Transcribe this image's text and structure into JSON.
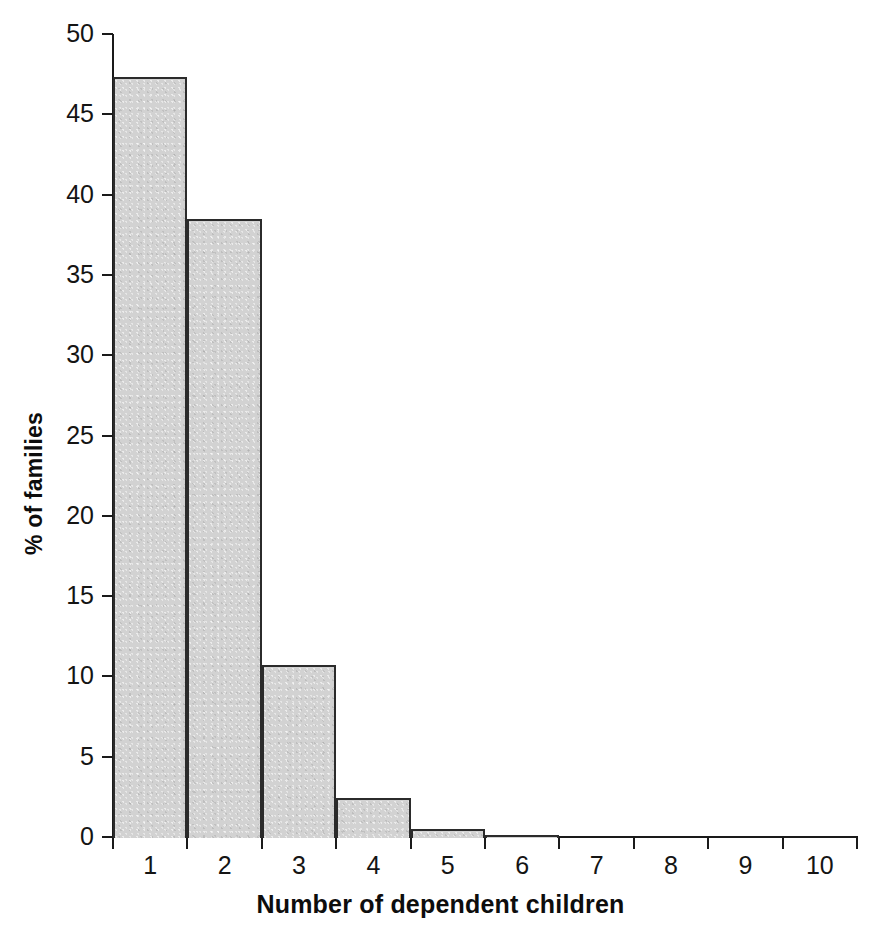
{
  "chart_data": {
    "type": "bar",
    "title": "",
    "subtitle": "",
    "xlabel": "Number of dependent children",
    "ylabel": "% of families",
    "categories": [
      "1",
      "2",
      "3",
      "4",
      "5",
      "6",
      "7",
      "8",
      "9",
      "10"
    ],
    "values": [
      47.3,
      38.5,
      10.7,
      2.4,
      0.5,
      0.1,
      0.0,
      0.0,
      0.0,
      0.0
    ],
    "series": [
      {
        "name": "% of families",
        "values": [
          47.3,
          38.5,
          10.7,
          2.4,
          0.5,
          0.1,
          0.0,
          0.0,
          0.0,
          0.0
        ]
      }
    ],
    "ylim": [
      0,
      50
    ],
    "ytick_labels": [
      "0",
      "5",
      "10",
      "15",
      "20",
      "25",
      "30",
      "35",
      "40",
      "45",
      "50"
    ],
    "ytick_values": [
      0,
      5,
      10,
      15,
      20,
      25,
      30,
      35,
      40,
      45,
      50
    ],
    "xtick_labels": [
      "1",
      "2",
      "3",
      "4",
      "5",
      "6",
      "7",
      "8",
      "9",
      "10"
    ],
    "grid": false,
    "legend": false,
    "legend_position": "none",
    "bar_fill_color": "#d2d2d2",
    "bar_border_color": "#2b2b2b",
    "axis_color": "#1a1a1a",
    "background_color": "#ffffff"
  }
}
